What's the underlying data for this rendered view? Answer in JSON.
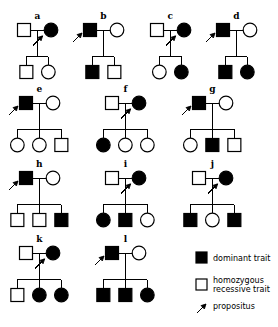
{
  "figure": {
    "symbol_colors": {
      "affected_fill": "#000000",
      "unaffected_fill": "#ffffff",
      "stroke": "#000000"
    }
  },
  "legend": {
    "items": [
      {
        "key": "dominant",
        "symbol": "filled-square",
        "label": "dominant trait"
      },
      {
        "key": "homozygous_recessive",
        "symbol": "open-square",
        "label": "homozygous\nrecessive trait"
      },
      {
        "key": "homozygous_recessive_line1",
        "label": "homozygous"
      },
      {
        "key": "homozygous_recessive_line2",
        "label": "recessive trait"
      },
      {
        "key": "propositus",
        "symbol": "arrow",
        "label": "propositus"
      }
    ],
    "dominant_label": "dominant trait",
    "recessive_label_line1": "homozygous",
    "recessive_label_line2": "recessive trait",
    "propositus_label": "propositus"
  },
  "pedigrees": [
    {
      "id": "a",
      "label": "a",
      "row": 1,
      "father": {
        "sex": "male",
        "shape": "square",
        "affected": false
      },
      "mother": {
        "sex": "female",
        "shape": "circle",
        "affected": true
      },
      "propositus": "mother",
      "children": [
        {
          "sex": "male",
          "shape": "square",
          "affected": false
        },
        {
          "sex": "female",
          "shape": "circle",
          "affected": false
        }
      ]
    },
    {
      "id": "b",
      "label": "b",
      "row": 1,
      "father": {
        "sex": "male",
        "shape": "square",
        "affected": true
      },
      "mother": {
        "sex": "female",
        "shape": "circle",
        "affected": false
      },
      "propositus": "father",
      "children": [
        {
          "sex": "male",
          "shape": "square",
          "affected": true
        },
        {
          "sex": "male",
          "shape": "square",
          "affected": false
        }
      ]
    },
    {
      "id": "c",
      "label": "c",
      "row": 1,
      "father": {
        "sex": "male",
        "shape": "square",
        "affected": false
      },
      "mother": {
        "sex": "female",
        "shape": "circle",
        "affected": true
      },
      "propositus": "mother",
      "children": [
        {
          "sex": "female",
          "shape": "circle",
          "affected": false
        },
        {
          "sex": "female",
          "shape": "circle",
          "affected": true
        }
      ]
    },
    {
      "id": "d",
      "label": "d",
      "row": 1,
      "father": {
        "sex": "male",
        "shape": "square",
        "affected": true
      },
      "mother": {
        "sex": "female",
        "shape": "circle",
        "affected": false
      },
      "propositus": "father",
      "children": [
        {
          "sex": "male",
          "shape": "square",
          "affected": true
        },
        {
          "sex": "female",
          "shape": "circle",
          "affected": true
        }
      ]
    },
    {
      "id": "e",
      "label": "e",
      "row": 2,
      "father": {
        "sex": "male",
        "shape": "square",
        "affected": true
      },
      "mother": {
        "sex": "female",
        "shape": "circle",
        "affected": false
      },
      "propositus": "father",
      "children": [
        {
          "sex": "female",
          "shape": "circle",
          "affected": false
        },
        {
          "sex": "female",
          "shape": "circle",
          "affected": false
        },
        {
          "sex": "male",
          "shape": "square",
          "affected": false
        }
      ]
    },
    {
      "id": "f",
      "label": "f",
      "row": 2,
      "father": {
        "sex": "male",
        "shape": "square",
        "affected": false
      },
      "mother": {
        "sex": "female",
        "shape": "circle",
        "affected": true
      },
      "propositus": "mother",
      "children": [
        {
          "sex": "female",
          "shape": "circle",
          "affected": true
        },
        {
          "sex": "female",
          "shape": "circle",
          "affected": false
        },
        {
          "sex": "female",
          "shape": "circle",
          "affected": false
        }
      ]
    },
    {
      "id": "g",
      "label": "g",
      "row": 2,
      "father": {
        "sex": "male",
        "shape": "square",
        "affected": true
      },
      "mother": {
        "sex": "female",
        "shape": "circle",
        "affected": false
      },
      "propositus": "father",
      "children": [
        {
          "sex": "female",
          "shape": "circle",
          "affected": false
        },
        {
          "sex": "male",
          "shape": "square",
          "affected": true
        },
        {
          "sex": "male",
          "shape": "square",
          "affected": false
        }
      ]
    },
    {
      "id": "h",
      "label": "h",
      "row": 3,
      "father": {
        "sex": "male",
        "shape": "square",
        "affected": true
      },
      "mother": {
        "sex": "female",
        "shape": "circle",
        "affected": false
      },
      "propositus": "father",
      "children": [
        {
          "sex": "male",
          "shape": "square",
          "affected": false
        },
        {
          "sex": "male",
          "shape": "square",
          "affected": false
        },
        {
          "sex": "male",
          "shape": "square",
          "affected": true
        }
      ]
    },
    {
      "id": "i",
      "label": "i",
      "row": 3,
      "father": {
        "sex": "male",
        "shape": "square",
        "affected": false
      },
      "mother": {
        "sex": "female",
        "shape": "circle",
        "affected": true
      },
      "propositus": "mother",
      "children": [
        {
          "sex": "female",
          "shape": "circle",
          "affected": true
        },
        {
          "sex": "male",
          "shape": "square",
          "affected": true
        },
        {
          "sex": "female",
          "shape": "circle",
          "affected": false
        }
      ]
    },
    {
      "id": "j",
      "label": "j",
      "row": 3,
      "father": {
        "sex": "male",
        "shape": "square",
        "affected": false
      },
      "mother": {
        "sex": "female",
        "shape": "circle",
        "affected": true
      },
      "propositus": "mother",
      "children": [
        {
          "sex": "male",
          "shape": "square",
          "affected": true
        },
        {
          "sex": "female",
          "shape": "circle",
          "affected": false
        },
        {
          "sex": "male",
          "shape": "square",
          "affected": true
        }
      ]
    },
    {
      "id": "k",
      "label": "k",
      "row": 4,
      "father": {
        "sex": "male",
        "shape": "square",
        "affected": false
      },
      "mother": {
        "sex": "female",
        "shape": "circle",
        "affected": true
      },
      "propositus": "mother",
      "children": [
        {
          "sex": "male",
          "shape": "square",
          "affected": false
        },
        {
          "sex": "female",
          "shape": "circle",
          "affected": true
        },
        {
          "sex": "female",
          "shape": "circle",
          "affected": true
        }
      ]
    },
    {
      "id": "l",
      "label": "l",
      "row": 4,
      "father": {
        "sex": "male",
        "shape": "square",
        "affected": true
      },
      "mother": {
        "sex": "female",
        "shape": "circle",
        "affected": false
      },
      "propositus": "father",
      "children": [
        {
          "sex": "male",
          "shape": "square",
          "affected": true
        },
        {
          "sex": "male",
          "shape": "square",
          "affected": true
        },
        {
          "sex": "female",
          "shape": "circle",
          "affected": true
        }
      ]
    }
  ]
}
